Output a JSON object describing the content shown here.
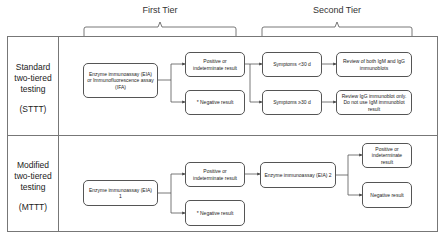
{
  "tiers": {
    "first": "First Tier",
    "second": "Second Tier"
  },
  "rows": [
    {
      "label_lines": [
        "Standard",
        "two-tiered",
        "testing",
        "",
        "(STTT)"
      ],
      "label": "Standard two-tiered testing (STTT)",
      "boxes": {
        "assay": "Enzyme immunoassay (EIA) or Immunofluorescence assay (IFA)",
        "positive": "Positive or indeterminate result",
        "negative": "* Negative result",
        "symptoms_lt30": "Symptoms <30 d",
        "symptoms_ge30": "Symptoms ≥30 d",
        "review_both": "Review of both IgM and IgG immunoblots",
        "review_igg": "Review IgG immunoblot only. Do not use IgM immunoblot result"
      }
    },
    {
      "label_lines": [
        "Modified",
        "two-tiered",
        "testing",
        "",
        "(MTTT)"
      ],
      "label": "Modified two-tiered testing (MTTT)",
      "boxes": {
        "assay1": "Enzyme immunoassay (EIA) 1",
        "positive": "Positive or indeterminate result",
        "negative": "* Negative result",
        "assay2": "Enzyme immunoassay (EIA) 2",
        "positive2": "Positive or indeterminate result",
        "negative2": "Negative result"
      }
    }
  ],
  "colors": {
    "line": "#555555",
    "frame": "#777777",
    "text": "#222222"
  }
}
